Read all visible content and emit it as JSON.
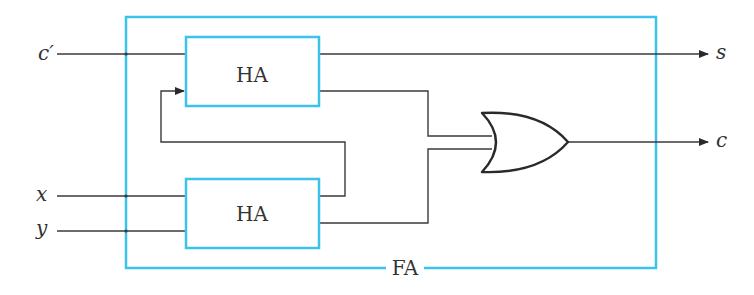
{
  "diagram": {
    "outer_block": {
      "label": "FA",
      "color": "#3cc3ec"
    },
    "blocks": [
      {
        "id": "ha_top",
        "label": "HA"
      },
      {
        "id": "ha_bottom",
        "label": "HA"
      }
    ],
    "gate": {
      "type": "OR"
    },
    "inputs": [
      {
        "id": "c_in",
        "label": "c′"
      },
      {
        "id": "x",
        "label": "x"
      },
      {
        "id": "y",
        "label": "y"
      }
    ],
    "outputs": [
      {
        "id": "s",
        "label": "s"
      },
      {
        "id": "c",
        "label": "c"
      }
    ],
    "colors": {
      "block_border": "#3cc3ec",
      "wire": "#3a3a3a"
    }
  }
}
